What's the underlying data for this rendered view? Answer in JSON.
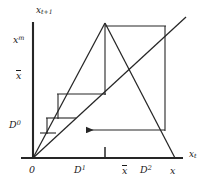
{
  "figure": {
    "type": "cobweb-diagram",
    "stroke_color": "#262626",
    "background_color": "#ffffff"
  },
  "axes": {
    "y_axis": {
      "label_main": "x",
      "label_sub": "t+1",
      "origin_px": [
        33,
        158
      ],
      "top_px": [
        33,
        22
      ]
    },
    "x_axis": {
      "label_main": "x",
      "label_sub": "t",
      "origin_px": [
        33,
        158
      ],
      "right_px": [
        183,
        158
      ]
    }
  },
  "y_labels": [
    {
      "name": "x-max",
      "main": "x",
      "sup": "m",
      "overbar": false,
      "y_px": 40
    },
    {
      "name": "x-bar",
      "main": "x",
      "sup": "",
      "overbar": true,
      "y_px": 76
    },
    {
      "name": "D-zero",
      "main": "D",
      "sup": "0",
      "overbar": false,
      "y_px": 126
    }
  ],
  "x_labels": [
    {
      "name": "zero",
      "main": "0",
      "sup": "",
      "overbar": false,
      "x_px": 29
    },
    {
      "name": "D-one",
      "main": "D",
      "sup": "1",
      "overbar": false,
      "x_px": 77
    },
    {
      "name": "x-bar",
      "main": "x",
      "sup": "",
      "overbar": true,
      "x_px": 125
    },
    {
      "name": "D-two",
      "main": "D",
      "sup": "2",
      "overbar": false,
      "x_px": 145
    },
    {
      "name": "x-final",
      "main": "x",
      "sup": "",
      "overbar": false,
      "x_px": 172
    }
  ],
  "geometry": {
    "tent_rising": {
      "from": [
        33,
        158
      ],
      "to": [
        105,
        23
      ]
    },
    "tent_falling": {
      "from": [
        105,
        23
      ],
      "to": [
        175,
        158
      ]
    },
    "diagonal_45": {
      "from": [
        33,
        158
      ],
      "to": [
        186,
        17
      ]
    },
    "top_horizontal": {
      "from": [
        105,
        26
      ],
      "to": [
        165,
        26
      ]
    },
    "right_vertical": {
      "from": [
        165,
        26
      ],
      "to": [
        165,
        130
      ]
    },
    "arrow_horizontal": {
      "from": [
        165,
        130
      ],
      "to": [
        84,
        130
      ]
    },
    "step_vertical_1": {
      "from": [
        105,
        23
      ],
      "to": [
        105,
        94
      ]
    },
    "step_horizontal_1": {
      "from": [
        58,
        94
      ],
      "to": [
        105,
        94
      ]
    },
    "step_vertical_2": {
      "from": [
        58,
        94
      ],
      "to": [
        58,
        118
      ]
    },
    "step_horizontal_2": {
      "from": [
        47,
        118
      ],
      "to": [
        75,
        118
      ]
    },
    "step_vertical_3": {
      "from": [
        47,
        118
      ],
      "to": [
        47,
        133
      ]
    },
    "step_horizontal_3": {
      "from": [
        40,
        133
      ],
      "to": [
        55,
        133
      ]
    },
    "tick_mark": {
      "x": 105,
      "from_y": 158,
      "to_y": 148
    }
  }
}
